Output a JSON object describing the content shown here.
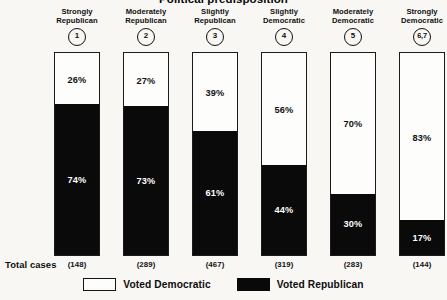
{
  "chart_data": {
    "type": "bar",
    "subtype": "100% stacked column",
    "title": "Political predisposition",
    "xlabel": "",
    "ylabel": "",
    "ylim": [
      0,
      100
    ],
    "grid": false,
    "legend_position": "bottom-center",
    "categories": [
      "Strongly Republican",
      "Moderately Republican",
      "Slightly Republican",
      "Slightly Democratic",
      "Moderately Democratic",
      "Strongly Democratic"
    ],
    "category_lines": [
      [
        "Strongly",
        "Republican"
      ],
      [
        "Moderately",
        "Republican"
      ],
      [
        "Slightly",
        "Republican"
      ],
      [
        "Slightly",
        "Democratic"
      ],
      [
        "Moderately",
        "Democratic"
      ],
      [
        "Strongly",
        "Democratic"
      ]
    ],
    "category_codes": [
      "1",
      "2",
      "3",
      "4",
      "5",
      "6,7"
    ],
    "series": [
      {
        "name": "Voted Democratic",
        "color": "#fdfdfb",
        "values": [
          26,
          27,
          39,
          56,
          70,
          83
        ],
        "labels": [
          "26%",
          "27%",
          "39%",
          "56%",
          "70%",
          "83%"
        ]
      },
      {
        "name": "Voted Republican",
        "color": "#0a0a0a",
        "values": [
          74,
          73,
          61,
          44,
          30,
          17
        ],
        "labels": [
          "74%",
          "73%",
          "61%",
          "44%",
          "30%",
          "17%"
        ]
      }
    ],
    "totals_label": "Total cases",
    "totals": [
      "(148)",
      "(289)",
      "(467)",
      "(319)",
      "(283)",
      "(144)"
    ],
    "totals_values": [
      148,
      289,
      467,
      319,
      283,
      144
    ]
  },
  "legend": {
    "items": [
      {
        "label": "Voted Democratic",
        "swatch": "white"
      },
      {
        "label": "Voted Republican",
        "swatch": "black"
      }
    ]
  }
}
